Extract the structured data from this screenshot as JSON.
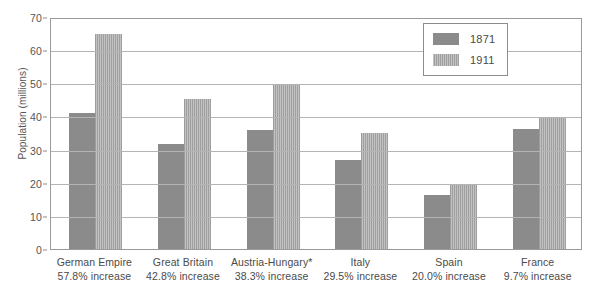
{
  "chart_data": {
    "type": "bar",
    "title": "",
    "xlabel": "",
    "ylabel": "Population (millions)",
    "ylim": [
      0,
      70
    ],
    "ytick_step": 10,
    "yticks": [
      0,
      10,
      20,
      30,
      40,
      50,
      60,
      70
    ],
    "grid": true,
    "legend_position": "top-right",
    "categories": [
      "German Empire",
      "Great Britain",
      "Austria-Hungary*",
      "Italy",
      "Spain",
      "France"
    ],
    "category_sublabels": [
      "57.8% increase",
      "42.8% increase",
      "38.3% increase",
      "29.5% increase",
      "20.0% increase",
      "9.7% increase"
    ],
    "series": [
      {
        "name": "1871",
        "color": "#8b8b8b",
        "values": [
          41.0,
          31.8,
          35.8,
          27.0,
          16.3,
          36.3
        ]
      },
      {
        "name": "1911",
        "color": "#a8a8a8",
        "values": [
          64.9,
          45.4,
          49.5,
          34.9,
          19.6,
          39.8
        ]
      }
    ]
  },
  "legend": {
    "items": [
      {
        "label": "1871",
        "swatch": "series-1871-swatch"
      },
      {
        "label": "1911",
        "swatch": "series-1911-swatch"
      }
    ]
  }
}
